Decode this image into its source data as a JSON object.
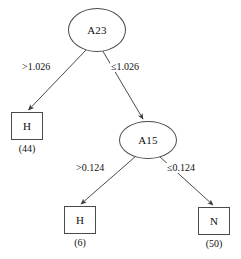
{
  "diagram": {
    "type": "decision-tree",
    "background_color": "#ffffff",
    "stroke_color": "#4a4a4a",
    "text_color": "#111111",
    "nodes": [
      {
        "id": "root",
        "shape": "ellipse",
        "label": "A23"
      },
      {
        "id": "leaf-left",
        "shape": "box",
        "label": "H",
        "count": "(44)"
      },
      {
        "id": "internal-a15",
        "shape": "ellipse",
        "label": "A15"
      },
      {
        "id": "leaf-mid",
        "shape": "box",
        "label": "H",
        "count": "(6)"
      },
      {
        "id": "leaf-right",
        "shape": "box",
        "label": "N",
        "count": "(50)"
      }
    ],
    "edges": [
      {
        "id": "edge-root-left",
        "from": "root",
        "to": "leaf-left",
        "label": ">1.026"
      },
      {
        "id": "edge-root-right",
        "from": "root",
        "to": "internal-a15",
        "label": "≤1.026"
      },
      {
        "id": "edge-a15-left",
        "from": "internal-a15",
        "to": "leaf-mid",
        "label": ">0.124"
      },
      {
        "id": "edge-a15-right",
        "from": "internal-a15",
        "to": "leaf-right",
        "label": "≤0.124"
      }
    ]
  }
}
